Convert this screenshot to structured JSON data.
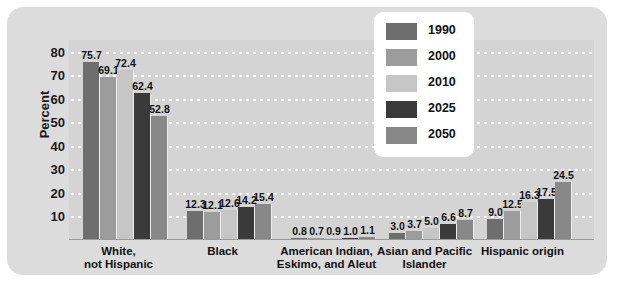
{
  "chart_data": {
    "type": "bar",
    "title": "",
    "xlabel": "",
    "ylabel": "Percent",
    "ylim": [
      0,
      85
    ],
    "yticks": [
      10,
      20,
      30,
      40,
      50,
      60,
      70,
      80
    ],
    "grid": true,
    "legend_position": "top-center",
    "categories": [
      "White,\nnot Hispanic",
      "Black",
      "American Indian,\nEskimo, and Aleut",
      "Asian and Pacific\nIslander",
      "Hispanic origin"
    ],
    "category_lines": [
      [
        "White,",
        "not Hispanic"
      ],
      [
        "Black",
        ""
      ],
      [
        "American Indian,",
        "Eskimo, and Aleut"
      ],
      [
        "Asian and Pacific",
        "Islander"
      ],
      [
        "Hispanic origin",
        ""
      ]
    ],
    "series": [
      {
        "name": "1990",
        "color": "#6e6e6e",
        "values": [
          75.7,
          12.3,
          0.8,
          3.0,
          9.0
        ]
      },
      {
        "name": "2000",
        "color": "#9c9c9c",
        "values": [
          69.1,
          12.1,
          0.7,
          3.7,
          12.5
        ]
      },
      {
        "name": "2010",
        "color": "#c6c6c6",
        "values": [
          72.4,
          12.6,
          0.9,
          5.0,
          16.3
        ]
      },
      {
        "name": "2025",
        "color": "#3a3a3a",
        "values": [
          62.4,
          14.2,
          1.0,
          6.6,
          17.5
        ]
      },
      {
        "name": "2050",
        "color": "#888888",
        "values": [
          52.8,
          15.4,
          1.1,
          8.7,
          24.5
        ]
      }
    ]
  },
  "colors": {
    "panel_background": "#dcdcdc",
    "plot_background": "#d4d4d4",
    "gridline": "#ffffff",
    "legend_background": "#ffffff",
    "text": "#111111"
  }
}
